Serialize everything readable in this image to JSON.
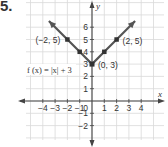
{
  "problem_number": "5.",
  "chart_data": {
    "type": "line",
    "title": "",
    "function_label": "f (x) = |x| + 3",
    "xlabel": "x",
    "ylabel": "y",
    "xlim": [
      -4.5,
      4.5
    ],
    "ylim": [
      -2.5,
      6.5
    ],
    "grid": true,
    "x_ticks": [
      -4,
      -3,
      -2,
      -1,
      1,
      2,
      3,
      4
    ],
    "x_tick_labels": [
      "−4",
      "−3",
      "−2",
      "−1",
      "1",
      "2",
      "3",
      "4"
    ],
    "y_ticks": [
      -2,
      -1,
      1,
      2,
      3,
      4,
      5,
      6
    ],
    "y_tick_labels": [
      "−2",
      "−1",
      "1",
      "2",
      "3",
      "4",
      "5",
      "6"
    ],
    "origin_label": "0",
    "series": [
      {
        "name": "f (x) = |x| + 3",
        "x": [
          -3.5,
          -2,
          -1,
          0,
          1,
          2,
          3.5
        ],
        "y": [
          6.5,
          5,
          4,
          3,
          4,
          5,
          6.5
        ],
        "color": "#555555"
      }
    ],
    "labeled_points": [
      {
        "x": -2,
        "y": 5,
        "label": "(−2, 5)"
      },
      {
        "x": 0,
        "y": 3,
        "label": "(0, 3)"
      },
      {
        "x": 2,
        "y": 5,
        "label": "(2, 5)"
      }
    ],
    "marked_points": [
      {
        "x": -2,
        "y": 5
      },
      {
        "x": -1,
        "y": 4
      },
      {
        "x": 0,
        "y": 3
      },
      {
        "x": 1,
        "y": 4
      },
      {
        "x": 2,
        "y": 5
      }
    ]
  }
}
